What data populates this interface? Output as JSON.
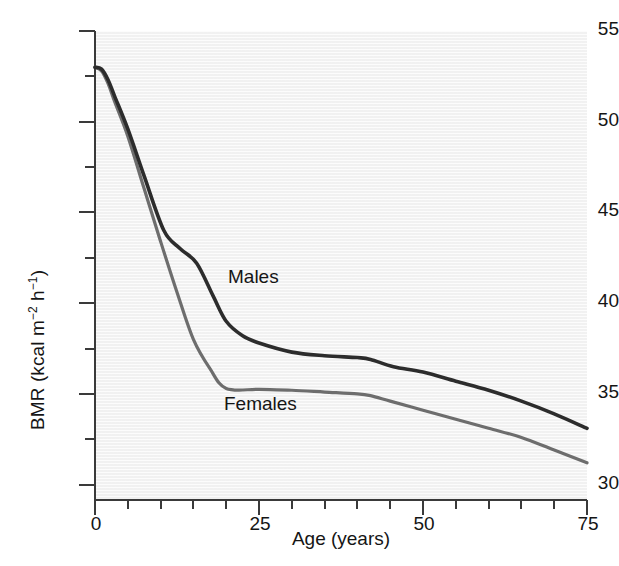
{
  "chart_data": {
    "type": "line",
    "title": "",
    "xlabel": "Age (years)",
    "ylabel": "BMR (kcal m−2 h−1)",
    "ylabel_parts": {
      "prefix": "BMR (kcal m",
      "sup1": "−2",
      "mid": " h",
      "sup2": "−1",
      "suffix": ")"
    },
    "xlim": [
      0,
      75
    ],
    "ylim": [
      29.15,
      55
    ],
    "grid": false,
    "legend_position": "inline-annotation",
    "xticks": [
      0,
      25,
      50,
      75
    ],
    "xtick_labels": [
      "0",
      "25",
      "50",
      "75"
    ],
    "xminor_ticks": [
      5,
      10,
      15,
      20,
      30,
      35,
      40,
      45,
      55,
      60,
      65,
      70
    ],
    "yticks": [
      30,
      35,
      40,
      45,
      50,
      55
    ],
    "ytick_labels": [
      "30",
      "35",
      "40",
      "45",
      "50",
      "55"
    ],
    "yminor_ticks": [
      32.5,
      37.5,
      42.5,
      47.5,
      52.5
    ],
    "colors": {
      "males_line": "#2c2c2c",
      "females_line": "#6d6d6d",
      "plot_background": "#f4f4f4",
      "axis": "#3a3a3a",
      "text": "#151515"
    },
    "series": [
      {
        "name": "Males",
        "color": "#2c2c2c",
        "annotation": "Males",
        "x": [
          0,
          1,
          2,
          3,
          5,
          7.5,
          10.5,
          13,
          15.5,
          18,
          20,
          22.5,
          25,
          30,
          35,
          40,
          42,
          45.5,
          50,
          55,
          60,
          65,
          70,
          75
        ],
        "values": [
          53.0,
          52.9,
          52.3,
          51.4,
          49.6,
          47.0,
          44.0,
          43.0,
          42.2,
          40.4,
          39.0,
          38.2,
          37.8,
          37.3,
          37.1,
          37.0,
          36.9,
          36.5,
          36.2,
          35.7,
          35.2,
          34.6,
          33.9,
          33.1
        ]
      },
      {
        "name": "Females",
        "color": "#6d6d6d",
        "annotation": "Females",
        "x": [
          0,
          1,
          2,
          3,
          5,
          7.5,
          10,
          12.5,
          15,
          17.5,
          20,
          25,
          30,
          35,
          40,
          42,
          45,
          50,
          55,
          60,
          65,
          70,
          75
        ],
        "values": [
          53.0,
          52.8,
          52.1,
          51.1,
          49.2,
          46.3,
          43.4,
          40.6,
          38.0,
          36.4,
          35.3,
          35.25,
          35.2,
          35.1,
          35.0,
          34.9,
          34.6,
          34.1,
          33.6,
          33.1,
          32.6,
          31.9,
          31.2
        ]
      }
    ]
  }
}
